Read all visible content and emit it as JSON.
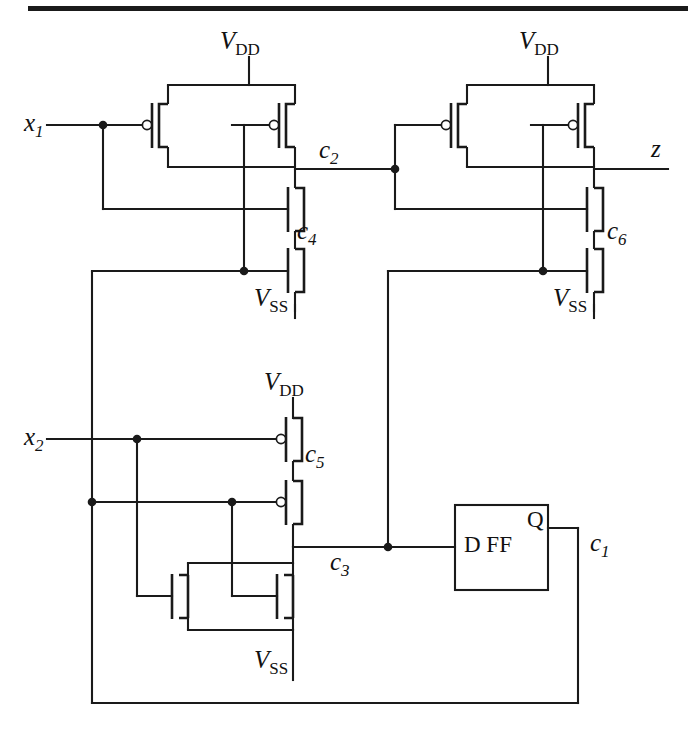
{
  "figure": {
    "kind": "cmos-transistor-level-schematic",
    "background_color": "#ffffff",
    "ink_color": "#1a1a1a",
    "top_rule": true
  },
  "labels": {
    "input_x1": {
      "base": "x",
      "sub": "1"
    },
    "input_x2": {
      "base": "x",
      "sub": "2"
    },
    "output_z": {
      "base": "z",
      "sub": ""
    },
    "node_c1": {
      "base": "c",
      "sub": "1"
    },
    "node_c2": {
      "base": "c",
      "sub": "2"
    },
    "node_c3": {
      "base": "c",
      "sub": "3"
    },
    "node_c4": {
      "base": "c",
      "sub": "4"
    },
    "node_c5": {
      "base": "c",
      "sub": "5"
    },
    "node_c6": {
      "base": "c",
      "sub": "6"
    },
    "supply_vdd": {
      "base": "V",
      "sub": "DD"
    },
    "supply_vss": {
      "base": "V",
      "sub": "SS"
    },
    "flipflop_body": "D  FF",
    "flipflop_q": "Q"
  },
  "labels_flat": {
    "x1": "x1",
    "x2": "x2",
    "z": "z",
    "c1": "c1",
    "c2": "c2",
    "c3": "c3",
    "c4": "c4",
    "c5": "c5",
    "c6": "c6",
    "vdd_top_left": "VDD",
    "vdd_top_right": "VDD",
    "vdd_bottom": "VDD",
    "vss_top_left": "VSS",
    "vss_top_right": "VSS",
    "vss_bottom": "VSS",
    "dff": "D  FF",
    "q": "Q"
  },
  "blocks": [
    {
      "name": "gate-top-left",
      "type": "static-cmos-gate",
      "pull_up": "two PMOS in parallel",
      "pull_down": "two NMOS in series",
      "inputs": [
        "x1",
        "c1"
      ],
      "output": "c2",
      "internal_node": "c4",
      "supplies": [
        "VDD",
        "VSS"
      ]
    },
    {
      "name": "gate-top-right",
      "type": "static-cmos-gate",
      "pull_up": "two PMOS in parallel",
      "pull_down": "two NMOS in series",
      "inputs": [
        "c2",
        "c3"
      ],
      "output": "z",
      "internal_node": "c6",
      "supplies": [
        "VDD",
        "VSS"
      ]
    },
    {
      "name": "gate-bottom",
      "type": "static-cmos-gate",
      "pull_up": "two PMOS in series",
      "pull_down": "two NMOS in parallel",
      "inputs": [
        "x2",
        "c1"
      ],
      "output": "c3",
      "internal_node": "c5",
      "supplies": [
        "VDD",
        "VSS"
      ]
    },
    {
      "name": "d-flip-flop",
      "type": "sequential-element",
      "input": "c3",
      "output": "c1",
      "body_label": "D  FF",
      "port_label": "Q"
    }
  ],
  "nets": [
    {
      "name": "x1",
      "from": "input-x1",
      "to": [
        "pmos-tl-a-gate",
        "nmos-tl-upper-gate"
      ]
    },
    {
      "name": "c1",
      "from": "dff-q",
      "to": [
        "pmos-tl-b-gate",
        "nmos-tl-lower-gate",
        "pmos-bl-b-gate",
        "nmos-bl-b-gate"
      ]
    },
    {
      "name": "c2",
      "from": "gate-top-left-output",
      "to": [
        "pmos-tr-a-gate",
        "nmos-tr-upper-gate"
      ]
    },
    {
      "name": "c3",
      "from": "gate-bottom-output",
      "to": [
        "dff-d",
        "pmos-tr-b-gate",
        "nmos-tr-lower-gate"
      ]
    },
    {
      "name": "x2",
      "from": "input-x2",
      "to": [
        "pmos-bl-a-gate",
        "nmos-bl-a-gate"
      ]
    },
    {
      "name": "z",
      "from": "gate-top-right-output",
      "to": [
        "output-z"
      ]
    }
  ]
}
